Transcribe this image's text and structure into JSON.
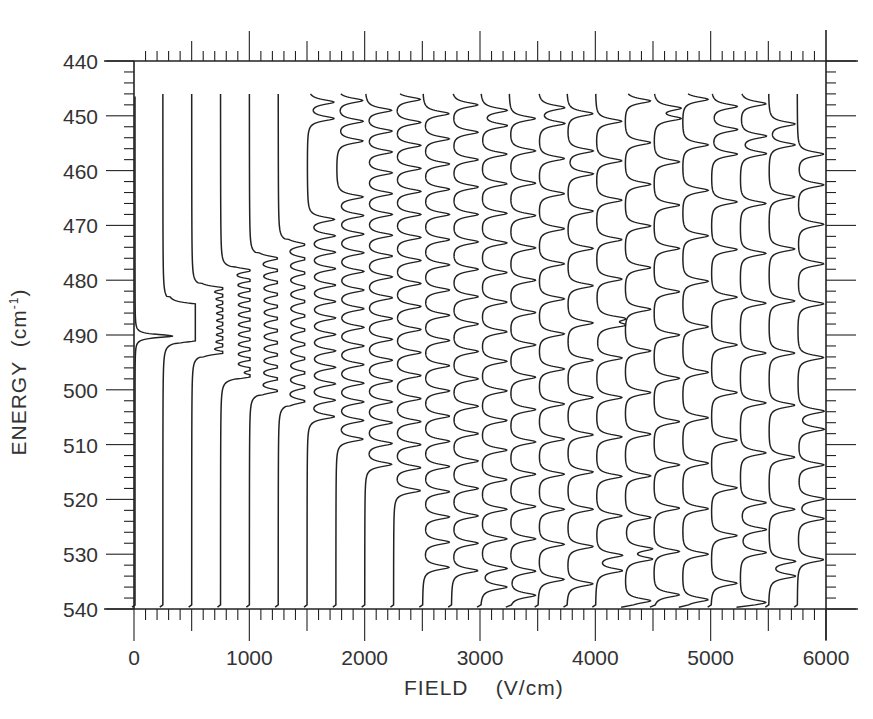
{
  "chart_data": {
    "type": "line",
    "subtype": "stacked-spectra (waterfall, vertical traces)",
    "title": "",
    "xlabel": "FIELD (V/cm)",
    "ylabel": "ENERGY (cm⁻¹)",
    "ylabel_main": "ENERGY",
    "ylabel_unit_prefix": "(cm",
    "ylabel_unit_sup": "-1",
    "ylabel_unit_suffix": ")",
    "xlim": [
      0,
      6000
    ],
    "ylim": [
      440,
      540
    ],
    "y_inverted": true,
    "x_ticks": [
      0,
      1000,
      2000,
      3000,
      4000,
      5000,
      6000
    ],
    "x_tick_labels": [
      "0",
      "1000",
      "2000",
      "3000",
      "4000",
      "5000",
      "6000"
    ],
    "x_minor_step": 100,
    "x_mid_step": 500,
    "y_ticks": [
      440,
      450,
      460,
      470,
      480,
      490,
      500,
      510,
      520,
      530,
      540
    ],
    "y_tick_labels": [
      "440",
      "450",
      "460",
      "470",
      "480",
      "490",
      "500",
      "510",
      "520",
      "530",
      "540"
    ],
    "y_minor_step": 2,
    "grid": false,
    "legend": null,
    "trace_energy_range": [
      446,
      539
    ],
    "trace_deflection_direction": "right (increasing field axis)",
    "series": [
      {
        "field": 0,
        "peaks": [
          490.2
        ],
        "band": [
          489,
          491
        ]
      },
      {
        "field": 250,
        "peaks": [
          484.5,
          485.3,
          486.1,
          486.9,
          487.7,
          488.5,
          489.3,
          490.1,
          490.9
        ],
        "band": [
          483,
          491.5
        ]
      },
      {
        "field": 500,
        "peaks": [
          481.5,
          482.8,
          484.1,
          485.4,
          486.7,
          488.0,
          489.3,
          490.6,
          491.9,
          493.2
        ],
        "band": [
          480.5,
          494
        ]
      },
      {
        "field": 750,
        "peaks": [
          478.2,
          480.0,
          481.8,
          483.6,
          485.4,
          487.2,
          489.0,
          490.8,
          492.6,
          494.4,
          496.2,
          497.5
        ],
        "band": [
          477.5,
          498
        ]
      },
      {
        "field": 1000,
        "peaks": [
          476.0,
          478.2,
          480.4,
          482.6,
          484.8,
          487.0,
          489.2,
          491.4,
          493.6,
          495.8,
          498.0,
          500.2
        ],
        "band": [
          475,
          501
        ]
      },
      {
        "field": 1250,
        "peaks": [
          473.5,
          476.1,
          478.7,
          481.3,
          483.9,
          486.5,
          489.1,
          491.7,
          494.3,
          496.9,
          499.5,
          502.1
        ],
        "band": [
          472.5,
          503
        ]
      },
      {
        "field": 1500,
        "peaks": [
          447.5,
          450.5,
          468.9,
          471.9,
          474.9,
          477.9,
          480.9,
          483.9,
          486.9,
          489.9,
          492.9,
          495.9,
          498.9,
          501.9,
          504.9
        ],
        "band": [
          446,
          540
        ]
      },
      {
        "field": 1750,
        "peaks": [
          447.2,
          451.0,
          454.6,
          464.8,
          468.2,
          471.6,
          475.0,
          478.4,
          481.8,
          485.2,
          488.6,
          492.0,
          495.4,
          498.8,
          502.2,
          505.6,
          509.0
        ],
        "band": [
          446,
          540
        ]
      },
      {
        "field": 2000,
        "peaks": [
          449.0,
          452.8,
          456.6,
          460.4,
          464.2,
          468.0,
          471.8,
          475.6,
          479.4,
          483.2,
          487.0,
          490.8,
          494.6,
          498.4,
          502.2,
          506.0,
          509.8,
          513.6
        ],
        "band": [
          446,
          540
        ]
      },
      {
        "field": 2250,
        "peaks": [
          447.0,
          451.2,
          455.4,
          459.6,
          463.8,
          468.0,
          472.2,
          476.4,
          480.6,
          484.8,
          489.0,
          493.2,
          497.4,
          501.6,
          505.8,
          510.0,
          514.2,
          518.4
        ],
        "band": [
          446,
          540
        ]
      },
      {
        "field": 2500,
        "peaks": [
          449.6,
          454.2,
          458.8,
          463.4,
          468.0,
          472.6,
          477.2,
          481.8,
          486.4,
          491.0,
          495.6,
          500.2,
          504.8,
          509.4,
          514.0,
          518.6,
          523.2,
          527.8,
          532.4
        ],
        "band": [
          446,
          540
        ]
      },
      {
        "field": 2750,
        "peaks": [
          448.0,
          453.0,
          458.0,
          463.0,
          468.0,
          473.0,
          478.0,
          483.0,
          488.0,
          493.0,
          498.0,
          503.0,
          508.0,
          513.0,
          518.0,
          523.0,
          528.0,
          533.0
        ],
        "band": [
          446,
          540
        ]
      },
      {
        "field": 3000,
        "peaks": [
          449.0,
          451.8,
          457.0,
          462.4,
          467.8,
          473.2,
          478.6,
          484.0,
          489.4,
          494.8,
          500.2,
          505.6,
          511.0,
          516.4,
          521.8,
          527.2,
          532.6,
          536.0
        ],
        "band": [
          446,
          540
        ]
      },
      {
        "field": 3250,
        "peaks": [
          450.5,
          456.4,
          462.3,
          468.2,
          474.1,
          480.0,
          485.9,
          491.8,
          497.7,
          503.6,
          509.5,
          515.4,
          521.3,
          527.2,
          533.1,
          537.5
        ],
        "band": [
          446,
          540
        ]
      },
      {
        "field": 3500,
        "peaks": [
          448.5,
          451.4,
          457.8,
          464.2,
          470.6,
          477.0,
          483.4,
          489.8,
          496.2,
          502.6,
          509.0,
          515.4,
          521.8,
          528.2,
          534.6
        ],
        "band": [
          446,
          540
        ]
      },
      {
        "field": 3750,
        "peaks": [
          449.6,
          456.4,
          460.6,
          467.4,
          474.2,
          481.0,
          487.8,
          494.6,
          501.4,
          508.2,
          515.0,
          521.8,
          528.6,
          535.4
        ],
        "band": [
          446,
          540
        ]
      },
      {
        "field": 4000,
        "peaks": [
          451.0,
          458.2,
          465.4,
          472.6,
          479.8,
          487.0,
          488.2,
          494.2,
          501.4,
          508.6,
          515.8,
          523.0,
          530.2,
          533.0
        ],
        "band": [
          446,
          540
        ]
      },
      {
        "field": 4250,
        "peaks": [
          447.3,
          454.9,
          462.5,
          470.1,
          477.7,
          485.3,
          492.9,
          500.5,
          508.1,
          515.7,
          523.3,
          529.0,
          530.9,
          538.5
        ],
        "band": [
          446,
          540
        ]
      },
      {
        "field": 4500,
        "peaks": [
          448.6,
          450.5,
          458.4,
          466.3,
          474.2,
          482.1,
          490.0,
          497.9,
          505.8,
          513.7,
          521.6,
          529.5,
          537.4
        ],
        "band": [
          446,
          540
        ]
      },
      {
        "field": 4750,
        "peaks": [
          447.0,
          455.3,
          463.6,
          471.9,
          480.2,
          488.5,
          496.8,
          505.1,
          513.4,
          521.7,
          530.0,
          538.3
        ],
        "band": [
          446,
          540
        ]
      },
      {
        "field": 5000,
        "peaks": [
          448.3,
          452.5,
          457.0,
          465.7,
          474.4,
          483.1,
          491.8,
          500.5,
          509.2,
          517.9,
          526.6,
          535.3
        ],
        "band": [
          446,
          540
        ]
      },
      {
        "field": 5250,
        "peaks": [
          447.8,
          453.7,
          456.9,
          466.0,
          475.1,
          484.2,
          493.3,
          502.4,
          511.5,
          520.6,
          525.5,
          529.7,
          538.8
        ],
        "band": [
          446,
          540
        ]
      },
      {
        "field": 5500,
        "peaks": [
          451.5,
          455.3,
          464.8,
          474.3,
          483.8,
          493.3,
          502.8,
          512.3,
          521.8,
          531.3,
          534.0
        ],
        "band": [
          446,
          540
        ]
      },
      {
        "field": 5750,
        "peaks": [
          457.0,
          462.6,
          469.8,
          477.0,
          484.3,
          494.1,
          503.9,
          507.2,
          513.7,
          519.9,
          523.5,
          531.0
        ],
        "band": [
          446,
          540
        ]
      }
    ]
  },
  "plot": {
    "frame": {
      "left": 134,
      "right": 826,
      "top": 61,
      "bottom": 609
    },
    "line_color": "#222222",
    "background": "#ffffff"
  }
}
